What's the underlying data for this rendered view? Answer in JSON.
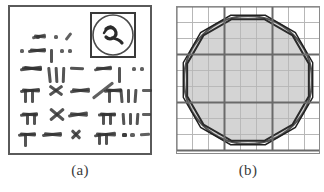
{
  "figure": {
    "background_color": "#ffffff",
    "ink_color": "#333333",
    "panel_count": 2
  },
  "panels": [
    {
      "id": "a",
      "caption": "(a)",
      "kind": "scanned-handwriting-thumbnail",
      "description": "Framed thumbnail of a scanned page of handwritten stroke-like marks with a boxed circular icon at the top right",
      "frame": {
        "border_color": "#5a5a5a",
        "border_width_px": 2,
        "fill_color": "#ffffff"
      },
      "inset_icon": {
        "name": "boxed-circle-scribble-icon",
        "x": 83,
        "y": 8,
        "size": 44,
        "border_color": "#3a3a3a",
        "circle_color": "#4a4a4a",
        "description": "square box containing an inscribed circle with a dark scribble mark inside"
      },
      "mark_rows": [
        {
          "y": 30,
          "marks": [
            {
              "x": 28,
              "w": 4,
              "h": 4,
              "rot": 0,
              "weight": 3
            },
            {
              "x": 24,
              "w": 14,
              "h": 3,
              "rot": -12,
              "weight": 3
            },
            {
              "x": 26,
              "w": 12,
              "h": 3,
              "rot": 6,
              "weight": 3
            },
            {
              "x": 46,
              "w": 4,
              "h": 4,
              "rot": 0,
              "weight": 3
            },
            {
              "x": 56,
              "w": 9,
              "h": 3,
              "rot": -52,
              "weight": 3
            }
          ]
        },
        {
          "y": 44,
          "marks": [
            {
              "x": 12,
              "w": 4,
              "h": 4,
              "rot": 0,
              "weight": 3
            },
            {
              "x": 20,
              "w": 18,
              "h": 3,
              "rot": -8,
              "weight": 4
            },
            {
              "x": 22,
              "w": 16,
              "h": 3,
              "rot": 4,
              "weight": 4
            },
            {
              "x": 42,
              "w": 3,
              "h": 14,
              "rot": 0,
              "weight": 4
            },
            {
              "x": 52,
              "w": 4,
              "h": 4,
              "rot": 0,
              "weight": 3
            },
            {
              "x": 60,
              "w": 4,
              "h": 4,
              "rot": 0,
              "weight": 3
            },
            {
              "x": 90,
              "w": 20,
              "h": 3,
              "rot": -6,
              "weight": 4
            },
            {
              "x": 92,
              "w": 18,
              "h": 3,
              "rot": 5,
              "weight": 4
            },
            {
              "x": 118,
              "w": 4,
              "h": 4,
              "rot": 0,
              "weight": 3
            }
          ]
        },
        {
          "y": 62,
          "marks": [
            {
              "x": 12,
              "w": 22,
              "h": 3,
              "rot": -7,
              "weight": 4
            },
            {
              "x": 14,
              "w": 20,
              "h": 3,
              "rot": 3,
              "weight": 4
            },
            {
              "x": 16,
              "w": 18,
              "h": 3,
              "rot": 8,
              "weight": 4
            },
            {
              "x": 40,
              "w": 3,
              "h": 16,
              "rot": -6,
              "weight": 4
            },
            {
              "x": 47,
              "w": 3,
              "h": 16,
              "rot": -3,
              "weight": 4
            },
            {
              "x": 54,
              "w": 3,
              "h": 16,
              "rot": 2,
              "weight": 4
            },
            {
              "x": 62,
              "w": 14,
              "h": 3,
              "rot": 2,
              "weight": 4
            },
            {
              "x": 86,
              "w": 18,
              "h": 3,
              "rot": -10,
              "weight": 4
            },
            {
              "x": 88,
              "w": 16,
              "h": 3,
              "rot": 2,
              "weight": 4
            },
            {
              "x": 110,
              "w": 3,
              "h": 16,
              "rot": 0,
              "weight": 4
            },
            {
              "x": 124,
              "w": 4,
              "h": 4,
              "rot": 0,
              "weight": 3
            },
            {
              "x": 132,
              "w": 4,
              "h": 4,
              "rot": 0,
              "weight": 3
            }
          ]
        },
        {
          "y": 84,
          "marks": [
            {
              "x": 12,
              "w": 20,
              "h": 3,
              "rot": -6,
              "weight": 4
            },
            {
              "x": 14,
              "w": 18,
              "h": 3,
              "rot": 4,
              "weight": 4
            },
            {
              "x": 16,
              "w": 3,
              "h": 14,
              "rot": 0,
              "weight": 4
            },
            {
              "x": 23,
              "w": 3,
              "h": 14,
              "rot": 0,
              "weight": 4
            },
            {
              "x": 40,
              "w": 16,
              "h": 3,
              "rot": -35,
              "weight": 4
            },
            {
              "x": 40,
              "w": 16,
              "h": 3,
              "rot": 35,
              "weight": 4
            },
            {
              "x": 62,
              "w": 20,
              "h": 3,
              "rot": -8,
              "weight": 4
            },
            {
              "x": 64,
              "w": 18,
              "h": 3,
              "rot": 6,
              "weight": 4
            },
            {
              "x": 82,
              "w": 26,
              "h": 3,
              "rot": -38,
              "weight": 3
            },
            {
              "x": 96,
              "w": 18,
              "h": 3,
              "rot": -6,
              "weight": 4
            },
            {
              "x": 98,
              "w": 16,
              "h": 3,
              "rot": 4,
              "weight": 4
            },
            {
              "x": 100,
              "w": 3,
              "h": 14,
              "rot": 0,
              "weight": 4
            },
            {
              "x": 112,
              "w": 3,
              "h": 14,
              "rot": -5,
              "weight": 4
            },
            {
              "x": 119,
              "w": 3,
              "h": 14,
              "rot": 0,
              "weight": 4
            },
            {
              "x": 126,
              "w": 3,
              "h": 14,
              "rot": 4,
              "weight": 4
            },
            {
              "x": 134,
              "w": 10,
              "h": 3,
              "rot": 0,
              "weight": 3
            }
          ]
        },
        {
          "y": 108,
          "marks": [
            {
              "x": 12,
              "w": 18,
              "h": 3,
              "rot": -6,
              "weight": 4
            },
            {
              "x": 14,
              "w": 16,
              "h": 3,
              "rot": 4,
              "weight": 4
            },
            {
              "x": 18,
              "w": 3,
              "h": 12,
              "rot": 0,
              "weight": 4
            },
            {
              "x": 25,
              "w": 3,
              "h": 12,
              "rot": 0,
              "weight": 4
            },
            {
              "x": 40,
              "w": 18,
              "h": 3,
              "rot": -40,
              "weight": 4
            },
            {
              "x": 40,
              "w": 18,
              "h": 3,
              "rot": 40,
              "weight": 4
            },
            {
              "x": 60,
              "w": 20,
              "h": 3,
              "rot": -10,
              "weight": 4
            },
            {
              "x": 62,
              "w": 18,
              "h": 3,
              "rot": 5,
              "weight": 4
            },
            {
              "x": 90,
              "w": 18,
              "h": 3,
              "rot": -4,
              "weight": 4
            },
            {
              "x": 92,
              "w": 16,
              "h": 3,
              "rot": 5,
              "weight": 4
            },
            {
              "x": 94,
              "w": 3,
              "h": 12,
              "rot": 0,
              "weight": 4
            },
            {
              "x": 101,
              "w": 3,
              "h": 12,
              "rot": 0,
              "weight": 4
            },
            {
              "x": 114,
              "w": 3,
              "h": 12,
              "rot": -4,
              "weight": 4
            },
            {
              "x": 121,
              "w": 3,
              "h": 12,
              "rot": 0,
              "weight": 4
            },
            {
              "x": 128,
              "w": 3,
              "h": 12,
              "rot": 4,
              "weight": 4
            },
            {
              "x": 134,
              "w": 9,
              "h": 3,
              "rot": 0,
              "weight": 3
            }
          ]
        },
        {
          "y": 128,
          "marks": [
            {
              "x": 10,
              "w": 18,
              "h": 3,
              "rot": -5,
              "weight": 4
            },
            {
              "x": 12,
              "w": 16,
              "h": 3,
              "rot": 5,
              "weight": 4
            },
            {
              "x": 16,
              "w": 3,
              "h": 14,
              "rot": 0,
              "weight": 4
            },
            {
              "x": 34,
              "w": 20,
              "h": 3,
              "rot": -6,
              "weight": 4
            },
            {
              "x": 36,
              "w": 18,
              "h": 3,
              "rot": 5,
              "weight": 4
            },
            {
              "x": 62,
              "w": 12,
              "h": 3,
              "rot": -45,
              "weight": 4
            },
            {
              "x": 62,
              "w": 12,
              "h": 3,
              "rot": 45,
              "weight": 4
            },
            {
              "x": 86,
              "w": 22,
              "h": 3,
              "rot": -8,
              "weight": 4
            },
            {
              "x": 88,
              "w": 20,
              "h": 3,
              "rot": 4,
              "weight": 4
            },
            {
              "x": 90,
              "w": 3,
              "h": 12,
              "rot": 0,
              "weight": 4
            },
            {
              "x": 97,
              "w": 3,
              "h": 12,
              "rot": 0,
              "weight": 4
            },
            {
              "x": 114,
              "w": 5,
              "h": 4,
              "rot": 0,
              "weight": 3
            },
            {
              "x": 122,
              "w": 5,
              "h": 4,
              "rot": 0,
              "weight": 3
            },
            {
              "x": 114,
              "w": 5,
              "h": 4,
              "rot": 0,
              "weight": 3
            },
            {
              "x": 132,
              "w": 10,
              "h": 3,
              "rot": -4,
              "weight": 3
            }
          ]
        }
      ]
    },
    {
      "id": "b",
      "caption": "(b)",
      "kind": "grid-circle-polygon-diagram",
      "description": "Square grid with a shaded circle overlaid by two polygons (an inscribed and a circumscribed dodecagon-like polygon)",
      "outer_border": {
        "color": "#8a8a8a",
        "width_px": 1
      },
      "grid": {
        "cell_size_px": 16,
        "cells_across": 9,
        "cells_down": 9,
        "minor_line_color": "#c9c9c9",
        "minor_line_width_px": 1,
        "major_line_color": "#6a6a6a",
        "major_line_width_px": 2,
        "major_every_n_cells": 3
      },
      "circle": {
        "center_x": 72,
        "center_y": 74,
        "radius_px": 64,
        "fill_color": "#d4d4d4",
        "stroke_color": "#555555",
        "stroke_width_px": 2
      },
      "polygon_inner": {
        "name": "inscribed-polygon",
        "sides": 12,
        "radius_px": 63,
        "rotation_deg": 15,
        "stroke_color": "#2a2a2a",
        "stroke_width_px": 2,
        "fill": "none"
      },
      "polygon_outer": {
        "name": "circumscribed-polygon",
        "sides": 12,
        "radius_px": 67,
        "rotation_deg": 15,
        "stroke_color": "#1f1f1f",
        "stroke_width_px": 1.4,
        "fill": "none"
      }
    }
  ]
}
